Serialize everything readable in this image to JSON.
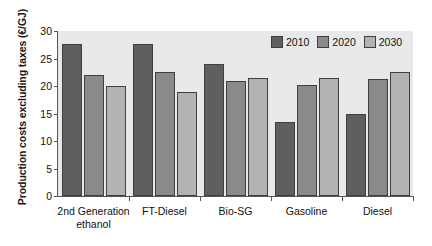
{
  "chart_data": {
    "type": "bar",
    "title": "",
    "xlabel": "",
    "ylabel": "Production costs excluding taxes (€/GJ)",
    "ylim": [
      0,
      30
    ],
    "yticks": [
      0,
      5,
      10,
      15,
      20,
      25,
      30
    ],
    "ytick_labels": [
      "0",
      "5",
      "10",
      "15",
      "20",
      "25",
      "30"
    ],
    "grid": false,
    "legend_position": "top-right",
    "categories": [
      "2nd Generation\nethanol",
      "FT-Diesel",
      "Bio-SG",
      "Gasoline",
      "Diesel"
    ],
    "series": [
      {
        "name": "2010",
        "color": "#5f5f5f",
        "values": [
          27.6,
          27.6,
          24.0,
          13.5,
          15.0
        ]
      },
      {
        "name": "2020",
        "color": "#8a8a8a",
        "values": [
          22.0,
          22.6,
          21.0,
          20.2,
          21.2
        ]
      },
      {
        "name": "2030",
        "color": "#b3b3b3",
        "values": [
          20.0,
          19.0,
          21.4,
          21.5,
          22.5
        ]
      }
    ]
  },
  "legend": {
    "entries": [
      {
        "label": "2010"
      },
      {
        "label": "2020"
      },
      {
        "label": "2030"
      }
    ]
  },
  "colors": {
    "plot_background": "#e9e9e9",
    "axis": "#555555",
    "bar_outline": "#3f3f3f",
    "text": "#111111",
    "series_2010": "#5f5f5f",
    "series_2020": "#8a8a8a",
    "series_2030": "#b3b3b3"
  }
}
